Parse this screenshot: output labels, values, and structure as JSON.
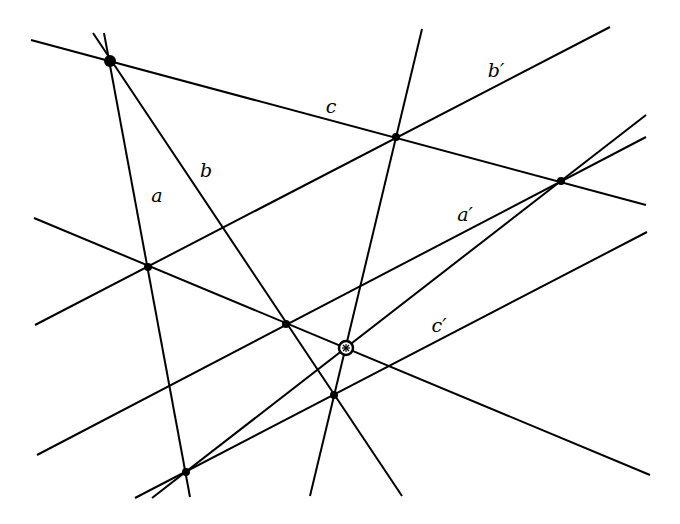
{
  "diagram": {
    "stroke": "#000000",
    "background": "#ffffff",
    "lines": [
      {
        "name": "line-c",
        "x1": 31,
        "y1": 40,
        "x2": 646,
        "y2": 205
      },
      {
        "name": "line-a",
        "x1": 104,
        "y1": 33,
        "x2": 190,
        "y2": 497
      },
      {
        "name": "line-b",
        "x1": 93,
        "y1": 33,
        "x2": 402,
        "y2": 496
      },
      {
        "name": "line-b-prime",
        "x1": 35,
        "y1": 325,
        "x2": 610,
        "y2": 27
      },
      {
        "name": "line-steep",
        "x1": 422,
        "y1": 29,
        "x2": 310,
        "y2": 496
      },
      {
        "name": "line-descending",
        "x1": 34,
        "y1": 218,
        "x2": 650,
        "y2": 475
      },
      {
        "name": "line-a-prime",
        "x1": 37,
        "y1": 455,
        "x2": 646,
        "y2": 137
      },
      {
        "name": "line-through-center",
        "x1": 152,
        "y1": 498,
        "x2": 646,
        "y2": 115
      },
      {
        "name": "line-c-prime",
        "x1": 135,
        "y1": 498,
        "x2": 647,
        "y2": 232
      }
    ],
    "points": [
      {
        "name": "apex-point",
        "x": 110,
        "y": 61,
        "r": 6
      },
      {
        "name": "point-c-steep",
        "x": 396,
        "y": 137,
        "r": 4
      },
      {
        "name": "point-right",
        "x": 561,
        "y": 181,
        "r": 4
      },
      {
        "name": "point-left",
        "x": 148,
        "y": 267,
        "r": 4
      },
      {
        "name": "point-middle",
        "x": 286,
        "y": 324,
        "r": 4
      },
      {
        "name": "point-lower",
        "x": 334,
        "y": 395,
        "r": 4
      },
      {
        "name": "point-bottom",
        "x": 186,
        "y": 472,
        "r": 4
      }
    ],
    "special_point": {
      "name": "circled-center-point",
      "x": 346,
      "y": 348,
      "r": 7
    },
    "labels": [
      {
        "name": "label-a",
        "text": "a",
        "x": 157,
        "y": 195
      },
      {
        "name": "label-b",
        "text": "b",
        "x": 206,
        "y": 170
      },
      {
        "name": "label-c",
        "text": "c",
        "x": 331,
        "y": 106
      },
      {
        "name": "label-b-prime",
        "text": "b′",
        "x": 496,
        "y": 70
      },
      {
        "name": "label-a-prime",
        "text": "a′",
        "x": 465,
        "y": 214
      },
      {
        "name": "label-c-prime",
        "text": "c′",
        "x": 439,
        "y": 325
      }
    ]
  }
}
